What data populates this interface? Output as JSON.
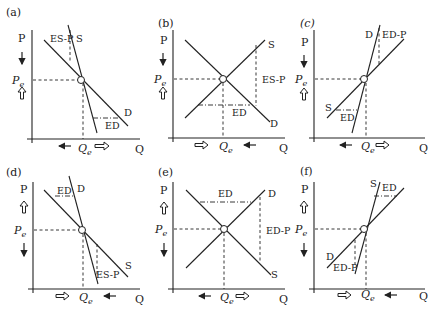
{
  "figure": {
    "axis_labels": {
      "x": "Q",
      "y": "P",
      "price_eq": "P",
      "price_eq_sub": "e",
      "qty_eq": "Q",
      "qty_eq_sub": "e"
    },
    "panels": [
      {
        "id": "a",
        "label": "(a)",
        "curve1": "S",
        "curve2": "D",
        "gap1": "ES-P",
        "gap2": "ED"
      },
      {
        "id": "b",
        "label": "(b)",
        "curve1": "S",
        "curve2": "D",
        "gap1": "ES-P",
        "gap2": "ED"
      },
      {
        "id": "c",
        "label": "(c)",
        "curve1": "D",
        "curve2": "S",
        "gap1": "ED-P",
        "gap2": "ED"
      },
      {
        "id": "d",
        "label": "(d)",
        "curve1": "D",
        "curve2": "S",
        "gap1": "ED",
        "gap2": "ES-P"
      },
      {
        "id": "e",
        "label": "(e)",
        "curve1": "D",
        "curve2": "S",
        "gap1": "ED",
        "gap2": "ED-P"
      },
      {
        "id": "f",
        "label": "(f)",
        "curve1": "S",
        "curve2": "D",
        "gap1": "ED",
        "gap2": "ED-P"
      }
    ]
  }
}
